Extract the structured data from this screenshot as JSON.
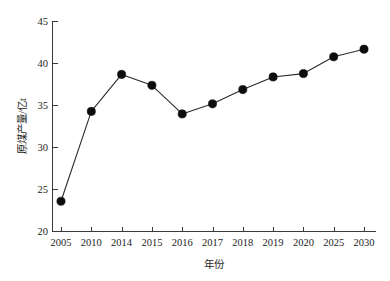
{
  "chart_data": {
    "type": "line",
    "title": "",
    "subtitle": "",
    "xlabel": "年份",
    "ylabel": "原煤产量/亿t",
    "categories": [
      "2005",
      "2010",
      "2014",
      "2015",
      "2016",
      "2017",
      "2018",
      "2019",
      "2020",
      "2025",
      "2030"
    ],
    "values": [
      23.6,
      34.3,
      38.7,
      37.4,
      34.0,
      35.2,
      36.9,
      38.4,
      38.8,
      40.8,
      41.7
    ],
    "series": [
      {
        "name": "原煤产量",
        "values": [
          23.6,
          34.3,
          38.7,
          37.4,
          34.0,
          35.2,
          36.9,
          38.4,
          38.8,
          40.8,
          41.7
        ]
      }
    ],
    "ylim": [
      20,
      45
    ],
    "yticks": [
      20,
      25,
      30,
      35,
      40,
      45
    ],
    "ytick_labels": [
      "20",
      "25",
      "30",
      "35",
      "40",
      "45"
    ],
    "xtick_labels": [
      "2005",
      "2010",
      "2014",
      "2015",
      "2016",
      "2017",
      "2018",
      "2019",
      "2020",
      "2025",
      "2030"
    ],
    "grid": false,
    "legend": false,
    "legend_position": "none",
    "marker": "filled-circle",
    "line_color": "#2b2b2b",
    "marker_color": "#0d0d0d",
    "background_color": "#ffffff",
    "annotations": []
  },
  "axes": {
    "x_title": "年份",
    "y_title": "原煤产量/亿t"
  },
  "ticks": {
    "y": [
      "45",
      "40",
      "35",
      "30",
      "25",
      "20"
    ],
    "x": [
      "2005",
      "2010",
      "2014",
      "2015",
      "2016",
      "2017",
      "2018",
      "2019",
      "2020",
      "2025",
      "2030"
    ]
  }
}
